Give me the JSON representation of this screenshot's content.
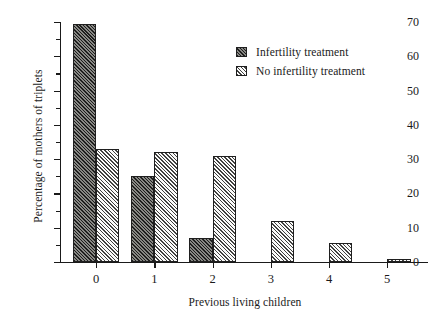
{
  "chart_data": {
    "type": "bar",
    "title": "",
    "xlabel": "Previous living children",
    "ylabel": "Percentage of mothers of triplets",
    "categories": [
      "0",
      "1",
      "2",
      "3",
      "4",
      "5"
    ],
    "series": [
      {
        "name": "Infertility treatment",
        "values": [
          69.5,
          25,
          7,
          0,
          0,
          0
        ],
        "color": "#54544f",
        "pattern": "dark-diagonal-hatch"
      },
      {
        "name": "No infertility treatment",
        "values": [
          33,
          32,
          31,
          12,
          5.5,
          1
        ],
        "color": "#c9c9c4",
        "pattern": "light-diagonal-hatch"
      }
    ],
    "ylim": [
      0,
      70
    ],
    "y_major_ticks": [
      0,
      10,
      20,
      30,
      40,
      50,
      60,
      70
    ],
    "y_minor_ticks": [
      5,
      15,
      25,
      35,
      45,
      55,
      65
    ],
    "y_tick_labels": [
      "0",
      "10",
      "20",
      "30",
      "40",
      "50",
      "60",
      "70"
    ],
    "grid": false,
    "legend_position": "top-right"
  }
}
